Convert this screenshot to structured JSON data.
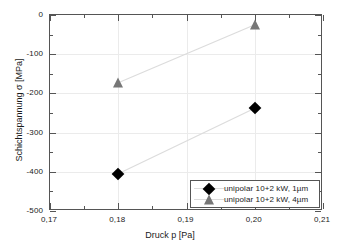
{
  "chart_data": {
    "type": "scatter",
    "title": "",
    "xlabel": "Druck p [Pa]",
    "ylabel": "Schichtspannung σ [MPa]",
    "xlim": [
      0.17,
      0.21
    ],
    "ylim": [
      -500,
      0
    ],
    "grid": true,
    "legend_position": "bottom-right",
    "x_tick_labels": [
      "0,17",
      "0,18",
      "0,19",
      "0,20",
      "0,21"
    ],
    "x_tick_values": [
      0.17,
      0.18,
      0.19,
      0.2,
      0.21
    ],
    "y_tick_labels": [
      "0",
      "-100",
      "-200",
      "-300",
      "-400",
      "-500"
    ],
    "y_tick_values": [
      0,
      -100,
      -200,
      -300,
      -400,
      -500
    ],
    "series": [
      {
        "name": "unipolar 10+2 kW, 1µm",
        "marker": "diamond",
        "color": "#000000",
        "line_color": "#dcdcdc",
        "x": [
          0.18,
          0.2
        ],
        "values": [
          -405,
          -238
        ]
      },
      {
        "name": "unipolar 10+2 kW, 4µm",
        "marker": "triangle",
        "color": "#777777",
        "line_color": "#dcdcdc",
        "x": [
          0.18,
          0.2
        ],
        "values": [
          -173,
          -25
        ]
      }
    ]
  }
}
